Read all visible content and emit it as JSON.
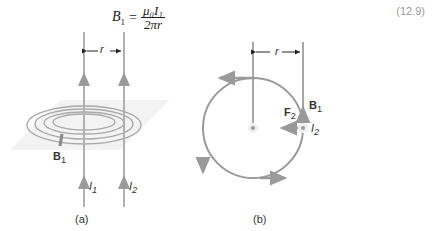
{
  "equation": {
    "lhs": "B",
    "lhs_sub": "1",
    "equals": "=",
    "numerator": "μ₀I₁",
    "denominator": "2πr",
    "number": "(12.9)"
  },
  "panel_a": {
    "caption": "(a)",
    "r_label": "r",
    "field_label": "B",
    "field_sub": "1",
    "current1": "I",
    "current1_sub": "1",
    "current2": "I",
    "current2_sub": "2"
  },
  "panel_b": {
    "caption": "(b)",
    "r_label": "r",
    "force_label": "F",
    "force_sub": "2",
    "field_label": "B",
    "field_sub": "1",
    "current_label": "I",
    "current_sub": "2"
  },
  "colors": {
    "line": "#9a9a9a",
    "text": "#333333"
  }
}
